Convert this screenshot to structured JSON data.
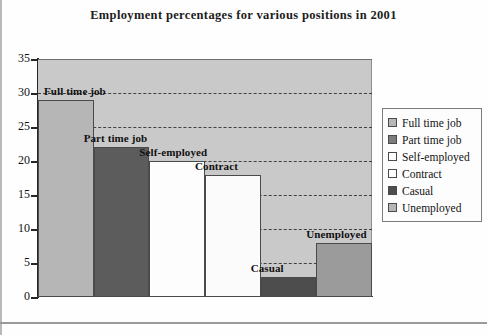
{
  "chart_data": {
    "type": "bar",
    "title": "Employment percentages for various positions in 2001",
    "xlabel": "",
    "ylabel": "",
    "ylim": [
      0,
      35
    ],
    "ytick_step": 5,
    "yticks": [
      "35",
      "30",
      "25",
      "20",
      "15",
      "10",
      "5",
      "0"
    ],
    "grid": true,
    "legend_position": "right",
    "categories": [
      "Full time job",
      "Part time job",
      "Self-employed",
      "Contract",
      "Casual",
      "Unemployed"
    ],
    "values": [
      29,
      22,
      20,
      18,
      3,
      8
    ],
    "bars": [
      {
        "label": "Full time job",
        "value": 29,
        "color": "#b6b6b6"
      },
      {
        "label": "Part time job",
        "value": 22,
        "color": "#5c5c5c"
      },
      {
        "label": "Self-employed",
        "value": 20,
        "color": "#fdfdfd"
      },
      {
        "label": "Contract",
        "value": 18,
        "color": "#fbfbfb"
      },
      {
        "label": "Casual",
        "value": 3,
        "color": "#4d4d4d"
      },
      {
        "label": "Unemployed",
        "value": 8,
        "color": "#9b9b9b"
      }
    ],
    "annotations": [
      {
        "text": "Full time job",
        "for": "Full time job"
      },
      {
        "text": "Part time job",
        "for": "Part time job"
      },
      {
        "text": "Self-employed",
        "for": "Self-employed"
      },
      {
        "text": "Contract",
        "for": "Contract"
      },
      {
        "text": "Casual",
        "for": "Casual"
      },
      {
        "text": "Unemployed",
        "for": "Unemployed"
      }
    ],
    "legend": [
      {
        "label": "Full time job",
        "color": "#b6b6b6"
      },
      {
        "label": "Part time job",
        "color": "#7c7c7c"
      },
      {
        "label": "Self-employed",
        "color": "#ffffff"
      },
      {
        "label": "Contract",
        "color": "#ffffff"
      },
      {
        "label": "Casual",
        "color": "#4d4d4d"
      },
      {
        "label": "Unemployed",
        "color": "#b6b6b6"
      }
    ],
    "plot_background": "#c9c9c9",
    "gridline_color": "#3a3a3a"
  }
}
